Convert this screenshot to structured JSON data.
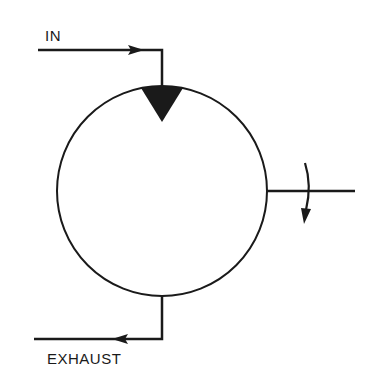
{
  "diagram": {
    "labels": {
      "inlet": "IN",
      "exhaust": "EXHAUST"
    },
    "colors": {
      "stroke": "#1a1a1a",
      "background": "#ffffff"
    }
  }
}
